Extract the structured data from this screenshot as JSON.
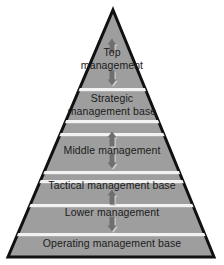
{
  "diagram": {
    "type": "pyramid",
    "shape": {
      "apex_x": 113,
      "apex_y": 10,
      "base_left_x": 8,
      "base_right_x": 214,
      "base_y": 257,
      "fill_color": "#9e9e9e",
      "outline_color": "#111111",
      "divider_color": "#f2f2f2",
      "background_color": "#ffffff",
      "text_color": "#1b1b1b"
    },
    "levels": [
      {
        "id": "top-management",
        "label": "Top\nmanagement",
        "kind": "management",
        "lines": 2,
        "label_y": 58
      },
      {
        "id": "strategic-management-base",
        "label": "Strategic\nmanagement base",
        "kind": "base",
        "lines": 2,
        "label_y": 104
      },
      {
        "id": "middle-management",
        "label": "Middle management",
        "kind": "management",
        "lines": 1,
        "label_y": 150
      },
      {
        "id": "tactical-management-base",
        "label": "Tactical management base",
        "kind": "base",
        "lines": 1,
        "label_y": 185
      },
      {
        "id": "lower-management",
        "label": "Lower management",
        "kind": "management",
        "lines": 1,
        "label_y": 212
      },
      {
        "id": "operating-management-base",
        "label": "Operating management base",
        "kind": "base",
        "lines": 1,
        "label_y": 243
      }
    ],
    "dividers_y": [
      88,
      120,
      133,
      171,
      180,
      204,
      233
    ],
    "arrows": [
      {
        "id": "arrow-up-top",
        "direction": "up",
        "x": 112,
        "y": 46
      },
      {
        "id": "arrow-down-top",
        "direction": "down",
        "x": 112,
        "y": 78
      },
      {
        "id": "arrow-up-middle",
        "direction": "up",
        "x": 112,
        "y": 139
      },
      {
        "id": "arrow-down-middle",
        "direction": "down",
        "x": 112,
        "y": 161
      },
      {
        "id": "arrow-up-lower",
        "direction": "up",
        "x": 112,
        "y": 197
      },
      {
        "id": "arrow-down-lower",
        "direction": "down",
        "x": 112,
        "y": 224
      }
    ],
    "arrow_color": "#6f6f6f",
    "arrow_shadow_color": "#cfcfcf"
  }
}
